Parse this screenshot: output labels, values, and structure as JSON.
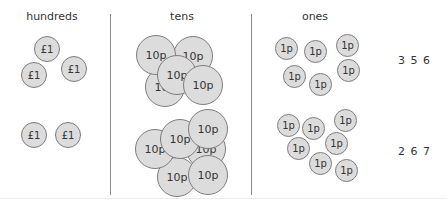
{
  "columns": {
    "hundreds": "hundreds",
    "tens": "tens",
    "ones": "ones"
  },
  "coins": {
    "pound": "£1",
    "ten": "10p",
    "one": "1p"
  },
  "rows": [
    {
      "hundreds_count": 3,
      "tens_count": 5,
      "ones_count": 6,
      "total": "3 5 6"
    },
    {
      "hundreds_count": 2,
      "tens_count": 6,
      "ones_count": 7,
      "total": "2 6 7"
    }
  ]
}
